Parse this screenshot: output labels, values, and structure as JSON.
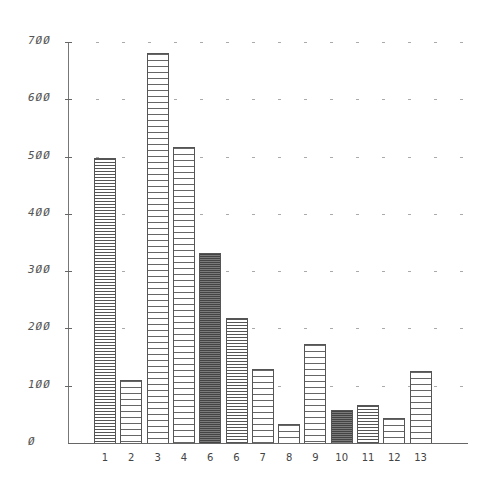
{
  "chart_data": {
    "type": "bar",
    "title": "",
    "xlabel": "",
    "ylabel": "",
    "ylim": [
      0,
      700
    ],
    "yticks": [
      "0",
      "100",
      "200",
      "300",
      "400",
      "500",
      "600",
      "700"
    ],
    "ytick_labels_display": [
      "Ø",
      "1ØØ",
      "2ØØ",
      "3ØØ",
      "4ØØ",
      "5ØØ",
      "6ØØ",
      "7ØØ"
    ],
    "categories": [
      "1",
      "2",
      "3",
      "4",
      "5",
      "6",
      "7",
      "8",
      "9",
      "10",
      "11",
      "12",
      "13"
    ],
    "x_labels_display": [
      "1",
      "2",
      "3",
      "4",
      "6",
      "6",
      "7",
      "8",
      "9",
      "10",
      "11",
      "12",
      "13"
    ],
    "values": [
      497,
      110,
      680,
      517,
      332,
      218,
      130,
      33,
      173,
      58,
      66,
      44,
      125
    ],
    "bar_styles": [
      "dense",
      "normal",
      "normal",
      "normal",
      "dark",
      "dense",
      "normal",
      "normal",
      "normal",
      "dark",
      "dense",
      "normal",
      "normal"
    ],
    "grid": "dotted horizontal at each 100",
    "legend": "none"
  }
}
